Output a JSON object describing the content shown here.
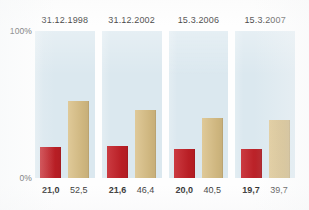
{
  "chart_data": {
    "type": "bar",
    "title": "",
    "xlabel": "",
    "ylabel": "",
    "ylim": [
      0,
      100
    ],
    "grid": false,
    "legend_position": "none",
    "categories": [
      "31.12.1998",
      "31.12.2002",
      "15.3.2006",
      "15.3.2007"
    ],
    "series": [
      {
        "name": "red",
        "color": "#c42027",
        "values": [
          21.0,
          21.6,
          20.0,
          19.7
        ],
        "labels": [
          "21,0",
          "21,6",
          "20,0",
          "19,7"
        ]
      },
      {
        "name": "tan",
        "color": "#d9bf85",
        "values": [
          52.5,
          46.4,
          40.5,
          39.7
        ],
        "labels": [
          "52,5",
          "46,4",
          "40,5",
          "39,7"
        ]
      }
    ],
    "axis_ticks": [
      {
        "value": 100,
        "label": "100%"
      },
      {
        "value": 0,
        "label": "0%"
      }
    ],
    "panel_background": "#dbe8ef"
  },
  "axis": {
    "top_label": "100%",
    "zero_label": "0%"
  },
  "panels": [
    {
      "header": "31.12.1998",
      "red_label": "21,0",
      "tan_label": "52,5",
      "red_value": 21.0,
      "tan_value": 52.5
    },
    {
      "header": "31.12.2002",
      "red_label": "21,6",
      "tan_label": "46,4",
      "red_value": 21.6,
      "tan_value": 46.4
    },
    {
      "header": "15.3.2006",
      "red_label": "20,0",
      "tan_label": "40,5",
      "red_value": 20.0,
      "tan_value": 40.5
    },
    {
      "header": "15.3.2007",
      "red_label": "19,7",
      "tan_label": "39,7",
      "red_value": 19.7,
      "tan_value": 39.7
    }
  ]
}
